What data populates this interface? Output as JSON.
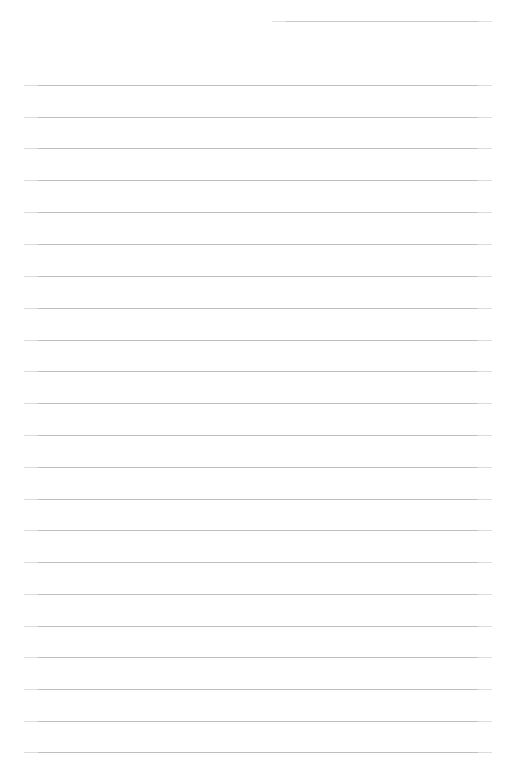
{
  "document": {
    "kind": "lined-paper",
    "title": "",
    "body_text": "",
    "is_blank": true,
    "page_width": 505,
    "page_height": 776,
    "background_color": "#ffffff",
    "rule_color": "#bfbfbf",
    "rule_thickness_px": 1,
    "rule_spacing_px": 31.8,
    "left_margin_x": 24,
    "right_margin_x": 492,
    "header_rule": {
      "name": "header-rule",
      "x_start": 272,
      "x_end": 492,
      "y": 21,
      "color": "#c6c6c6"
    },
    "rules": [
      {
        "y": 85,
        "x_start": 24,
        "x_end": 492
      },
      {
        "y": 117,
        "x_start": 24,
        "x_end": 492
      },
      {
        "y": 148,
        "x_start": 24,
        "x_end": 492
      },
      {
        "y": 180,
        "x_start": 24,
        "x_end": 492
      },
      {
        "y": 212,
        "x_start": 24,
        "x_end": 492
      },
      {
        "y": 244,
        "x_start": 24,
        "x_end": 492
      },
      {
        "y": 276,
        "x_start": 24,
        "x_end": 492
      },
      {
        "y": 308,
        "x_start": 24,
        "x_end": 492
      },
      {
        "y": 340,
        "x_start": 24,
        "x_end": 492
      },
      {
        "y": 371,
        "x_start": 24,
        "x_end": 492
      },
      {
        "y": 403,
        "x_start": 24,
        "x_end": 492
      },
      {
        "y": 435,
        "x_start": 24,
        "x_end": 492
      },
      {
        "y": 467,
        "x_start": 24,
        "x_end": 492
      },
      {
        "y": 499,
        "x_start": 24,
        "x_end": 492
      },
      {
        "y": 530,
        "x_start": 24,
        "x_end": 492
      },
      {
        "y": 562,
        "x_start": 24,
        "x_end": 492
      },
      {
        "y": 594,
        "x_start": 24,
        "x_end": 492
      },
      {
        "y": 626,
        "x_start": 24,
        "x_end": 492
      },
      {
        "y": 657,
        "x_start": 24,
        "x_end": 492
      },
      {
        "y": 689,
        "x_start": 24,
        "x_end": 492
      },
      {
        "y": 721,
        "x_start": 24,
        "x_end": 492
      },
      {
        "y": 752,
        "x_start": 24,
        "x_end": 492
      }
    ]
  }
}
